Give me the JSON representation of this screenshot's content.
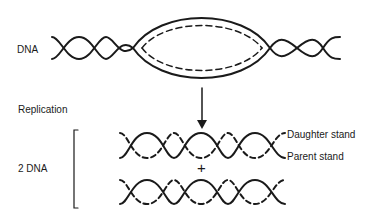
{
  "labels": {
    "dna": "DNA",
    "replication": "Replication",
    "two_dna": "2 DNA",
    "daughter": "Daughter stand",
    "parent": "Parent stand",
    "plus": "+"
  },
  "colors": {
    "stroke": "#1a1a1a",
    "background": "#ffffff"
  }
}
